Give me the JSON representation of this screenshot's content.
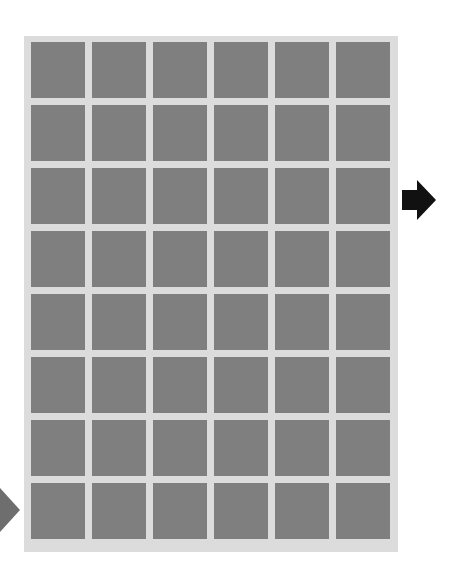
{
  "figure": {
    "grid": {
      "rows": 8,
      "cols": 6
    },
    "colors": {
      "background": "#ffffff",
      "frame": "#dcdcdc",
      "tile": "#7f7f7f",
      "arrow_right": "#111111",
      "arrow_left": "#6e6e6e"
    },
    "filters_frequency": [
      [
        "high",
        "mid",
        "mid",
        "low",
        "high",
        "mid"
      ],
      [
        "low",
        "high",
        "mid",
        "low",
        "mid",
        "high"
      ],
      [
        "mid",
        "mid",
        "high",
        "high",
        "low",
        "mid"
      ],
      [
        "mid",
        "high",
        "mid",
        "high",
        "high",
        "mid"
      ],
      [
        "high",
        "high",
        "low",
        "mid",
        "high",
        "high"
      ],
      [
        "mid",
        "low",
        "mid",
        "high",
        "mid",
        "high"
      ],
      [
        "low",
        "high",
        "mid",
        "mid",
        "high",
        "low"
      ],
      [
        "high",
        "low",
        "mid",
        "high",
        "low",
        "high"
      ]
    ],
    "icons": {
      "right": "arrow-right-icon",
      "left": "arrow-left-icon"
    }
  }
}
